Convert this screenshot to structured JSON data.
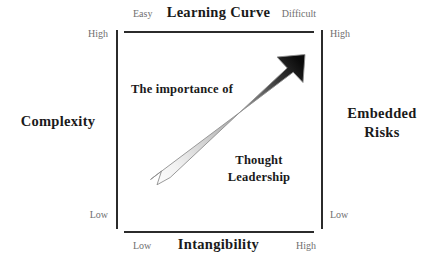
{
  "diagram": {
    "type": "2x2-positioning-matrix",
    "axes": {
      "top": {
        "title": "Learning Curve",
        "low_label": "Easy",
        "high_label": "Difficult"
      },
      "bottom": {
        "title": "Intangibility",
        "low_label": "Low",
        "high_label": "High"
      },
      "left": {
        "title": "Complexity",
        "high_label": "High",
        "low_label": "Low"
      },
      "right": {
        "title_line1": "Embedded",
        "title_line2": "Risks",
        "high_label": "High",
        "low_label": "Low"
      }
    },
    "arrow": {
      "name": "thought-leadership-arrow",
      "direction": "lower-left-to-upper-right",
      "gradient_start_color": "#fbfbfb",
      "gradient_end_color": "#0d0d0d",
      "outline_color": "#8a8a8a"
    },
    "annotations": {
      "upper": "The importance of",
      "lower_line1": "Thought",
      "lower_line2": "Leadership"
    },
    "colors": {
      "frame": "#2b2b2b",
      "title_text": "#1a1a1a",
      "tick_text": "#6f6f6f",
      "background": "#ffffff"
    }
  }
}
